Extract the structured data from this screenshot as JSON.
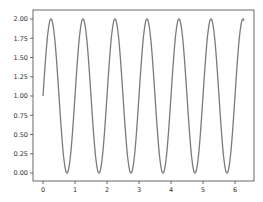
{
  "chart_data": {
    "type": "line",
    "title": "",
    "xlabel": "",
    "ylabel": "",
    "function": "y = 1 + sin(2*pi*x)",
    "x_range": [
      0,
      6.283
    ],
    "xlim": [
      -0.3,
      6.6
    ],
    "ylim": [
      -0.1,
      2.1
    ],
    "grid": false,
    "legend": null,
    "x_ticks": [
      0,
      1,
      2,
      3,
      4,
      5,
      6
    ],
    "x_tick_labels": [
      "0",
      "1",
      "2",
      "3",
      "4",
      "5",
      "6"
    ],
    "y_ticks": [
      0.0,
      0.25,
      0.5,
      0.75,
      1.0,
      1.25,
      1.5,
      1.75,
      2.0
    ],
    "y_tick_labels": [
      "0.00",
      "0.25",
      "0.50",
      "0.75",
      "1.00",
      "1.25",
      "1.50",
      "1.75",
      "2.00"
    ],
    "series": [
      {
        "name": "series-1",
        "color": "#7a7a7a",
        "x": [
          0,
          0.25,
          0.5,
          0.75,
          1,
          1.25,
          1.5,
          1.75,
          2,
          2.25,
          2.5,
          2.75,
          3,
          3.25,
          3.5,
          3.75,
          4,
          4.25,
          4.5,
          4.75,
          5,
          5.25,
          5.5,
          5.75,
          6,
          6.25,
          6.283
        ],
        "values": [
          1.0,
          2.0,
          1.0,
          0.0,
          1.0,
          2.0,
          1.0,
          0.0,
          1.0,
          2.0,
          1.0,
          0.0,
          1.0,
          2.0,
          1.0,
          0.0,
          1.0,
          2.0,
          1.0,
          0.0,
          1.0,
          2.0,
          1.0,
          0.0,
          1.0,
          2.0,
          1.98
        ]
      }
    ],
    "peaks_x": [
      0.25,
      1.25,
      2.25,
      3.25,
      4.25,
      5.25,
      6.25
    ],
    "troughs_x": [
      0.75,
      1.75,
      2.75,
      3.75,
      4.75,
      5.75
    ]
  },
  "layout": {
    "frame": {
      "left": 33,
      "top": 10,
      "right": 254,
      "bottom": 181
    },
    "x_px_per_unit": 32,
    "x_zero_px": 43,
    "y_px_per_unit": 77,
    "y_zero_px": 173,
    "frame_color": "#444444",
    "line_width": 1.3
  }
}
